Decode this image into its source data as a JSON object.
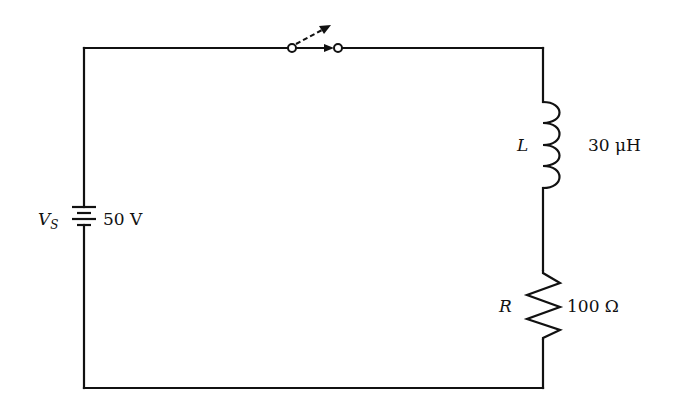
{
  "diagram": {
    "type": "RL series circuit",
    "components": {
      "source": {
        "symbol": "V",
        "subscript": "S",
        "value": "50 V"
      },
      "switch": {
        "state": "open, closing"
      },
      "inductor": {
        "symbol": "L",
        "value": "30 μH"
      },
      "resistor": {
        "symbol": "R",
        "value": "100 Ω"
      }
    }
  },
  "colors": {
    "wire": "#111111",
    "background": "#ffffff"
  }
}
